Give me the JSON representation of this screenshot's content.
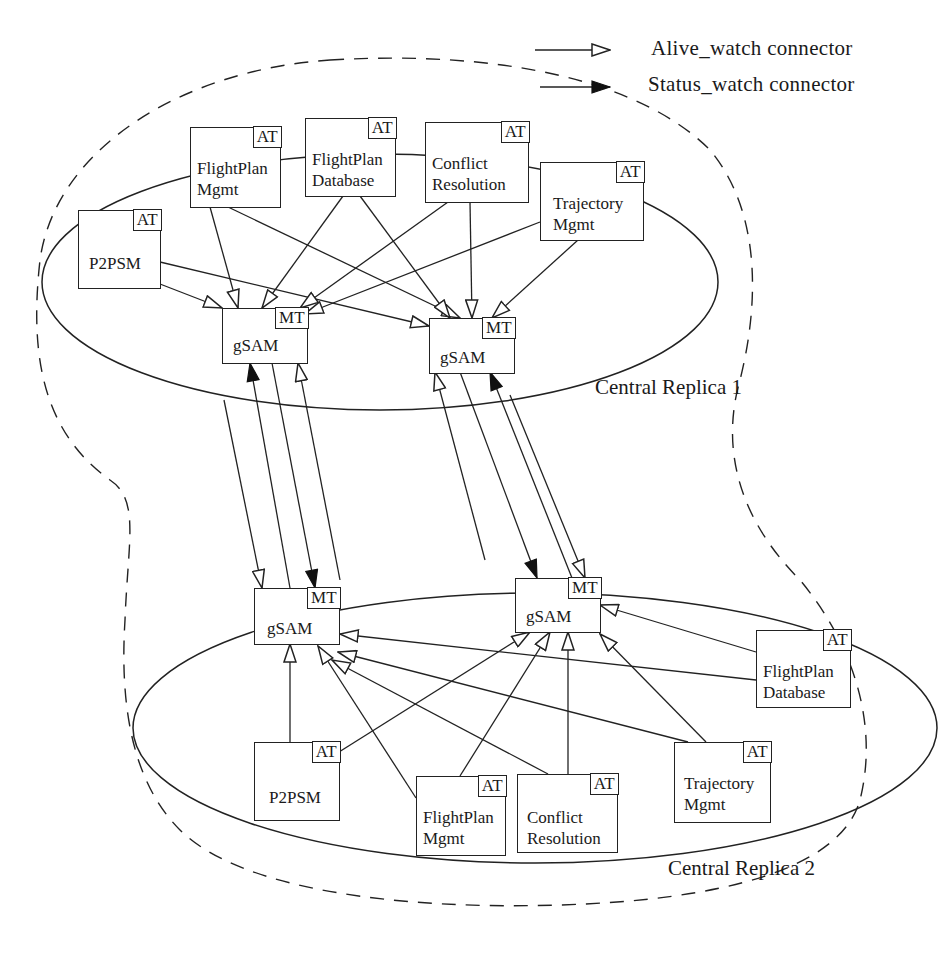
{
  "legend": {
    "alive_watch": "Alive_watch  connector",
    "status_watch": "Status_watch  connector"
  },
  "regions": {
    "replica1": "Central Replica 1",
    "replica2": "Central Replica 2"
  },
  "tags": {
    "at": "AT",
    "mt": "MT"
  },
  "replica1_nodes": {
    "p2psm": "P2PSM",
    "fp_mgmt": "FlightPlan\nMgmt",
    "fp_db": "FlightPlan\nDatabase",
    "conflict": "Conflict\nResolution",
    "trajectory": "Trajectory\nMgmt",
    "gsam_left": "gSAM",
    "gsam_right": "gSAM"
  },
  "replica2_nodes": {
    "gsam_left": "gSAM",
    "gsam_right": "gSAM",
    "fp_db": "FlightPlan\nDatabase",
    "p2psm": "P2PSM",
    "fp_mgmt": "FlightPlan\nMgmt",
    "conflict": "Conflict\nResolution",
    "trajectory": "Trajectory\nMgmt"
  },
  "colors": {
    "line": "#222222",
    "background": "#ffffff"
  }
}
